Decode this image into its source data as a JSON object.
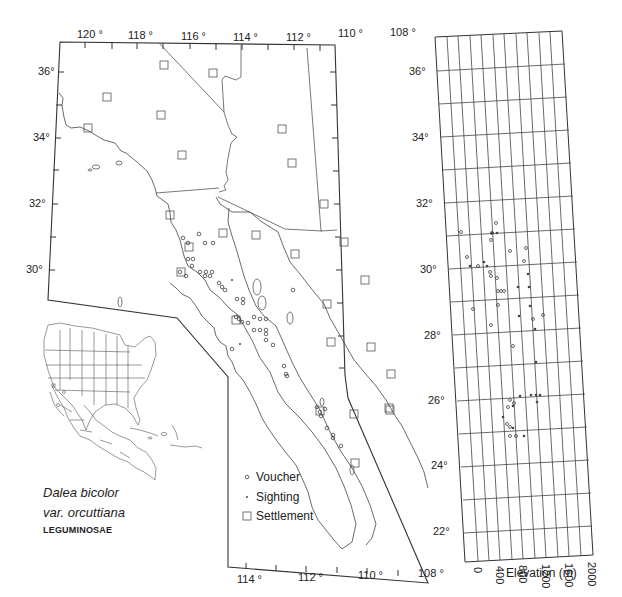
{
  "title": {
    "species_line1": "Dalea bicolor",
    "species_line2": "var. orcuttiana",
    "family": "LEGUMINOSAE"
  },
  "map": {
    "top_lon_labels": [
      "120 °",
      "118 °",
      "116 °",
      "114 °",
      "112 °",
      "110 °",
      "108 °"
    ],
    "bottom_lon_labels": [
      "114 °",
      "112 °",
      "110 °",
      "108 °"
    ],
    "left_lat_labels": [
      "36°",
      "34°",
      "32°",
      "30°"
    ],
    "right_lat_labels": [
      "36°",
      "34°",
      "32°",
      "30°",
      "28°",
      "26°",
      "24°",
      "22°"
    ],
    "legend": {
      "voucher": "Voucher",
      "sighting": "Sighting",
      "settlement": "Settlement"
    }
  },
  "elevation_plot": {
    "xlabel": "Elevation (m)",
    "x_ticks": [
      "0",
      "400",
      "800",
      "1200",
      "1600",
      "2000"
    ]
  },
  "colors": {
    "line": "#333333",
    "thin_line": "#555555",
    "background": "#ffffff"
  }
}
